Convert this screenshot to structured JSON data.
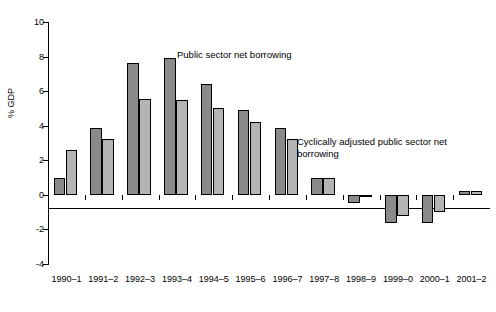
{
  "chart_data": {
    "type": "bar",
    "title": "",
    "xlabel": "",
    "ylabel": "% GDP",
    "ylim": [
      -4,
      10
    ],
    "yticks": [
      -4,
      -2,
      0,
      2,
      4,
      6,
      8,
      10
    ],
    "ytick_labels": [
      "-4",
      "-2",
      "0",
      "2",
      "4",
      "6",
      "8",
      "10"
    ],
    "grid": false,
    "legend_position": "inline-annotations",
    "categories": [
      "1990–1",
      "1991–2",
      "1992–3",
      "1993–4",
      "1994–5",
      "1995–6",
      "1996–7",
      "1997–8",
      "1998–9",
      "1999–0",
      "2000–1",
      "2001–2"
    ],
    "series": [
      {
        "name": "Public sector net borrowing",
        "color": "#8a8a8a",
        "values": [
          1.0,
          3.85,
          7.65,
          7.9,
          6.4,
          4.9,
          3.85,
          0.95,
          -0.5,
          -1.6,
          -1.6,
          0.2
        ]
      },
      {
        "name": "Cyclically adjusted public sector net borrowing",
        "color": "#b4b4b4",
        "values": [
          2.6,
          3.25,
          5.55,
          5.5,
          5.0,
          4.2,
          3.25,
          0.95,
          -0.1,
          -1.25,
          -1.0,
          0.2
        ]
      }
    ],
    "annotations": [
      {
        "text": "Public sector net borrowing"
      },
      {
        "text": "Cyclically adjusted public sector net\nborrowing"
      }
    ]
  }
}
